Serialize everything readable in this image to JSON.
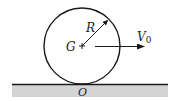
{
  "diagram": {
    "labels": {
      "radius": "R",
      "center": "G",
      "velocity": "V",
      "velocity_subscript": "0",
      "contact_point": "O"
    },
    "colors": {
      "stroke": "#1a1a1a",
      "ground_fill": "#d4d4d4",
      "background": "#ffffff"
    }
  }
}
